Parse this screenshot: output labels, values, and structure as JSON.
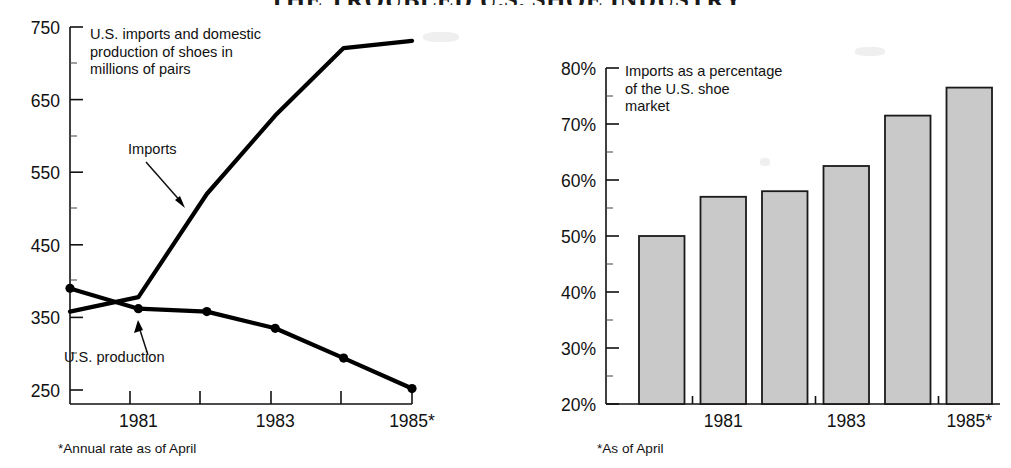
{
  "headline": "THE TROUBLED U.S. SHOE INDUSTRY",
  "left_panel": {
    "note": "U.S. imports and domestic\nproduction of shoes in\nmillions of pairs",
    "series_labels": {
      "imports": "Imports",
      "production": "U.S. production"
    },
    "footnote": "*Annual rate as of April"
  },
  "right_panel": {
    "note": "Imports as a percentage\nof the U.S. shoe\nmarket",
    "footnote": "*As of April"
  },
  "colors": {
    "ink": "#111111",
    "bar_fill": "#c9c9c9",
    "bar_stroke": "#1a1a1a",
    "background": "#ffffff"
  },
  "chart_data": [
    {
      "type": "line",
      "id": "shoe-volume-line-chart",
      "title": "U.S. imports and domestic production of shoes in millions of pairs",
      "xlabel": "",
      "ylabel": "millions of pairs",
      "x": [
        "1980",
        "1981",
        "1982",
        "1983",
        "1984",
        "1985*"
      ],
      "tick_labels": [
        "",
        "1981",
        "",
        "1983",
        "",
        "1985*"
      ],
      "yticks": [
        250,
        350,
        450,
        550,
        650,
        750
      ],
      "ytick_labels": [
        "250",
        "350",
        "450",
        "550",
        "650",
        "750"
      ],
      "ylim": [
        235,
        750
      ],
      "grid": false,
      "legend": "annotations",
      "series": [
        {
          "name": "Imports",
          "values": [
            358,
            378,
            520,
            628,
            721,
            731
          ],
          "markers": false,
          "annotation": "Imports"
        },
        {
          "name": "U.S. production",
          "values": [
            390,
            362,
            358,
            335,
            294,
            252
          ],
          "markers": true,
          "annotation": "U.S. production"
        }
      ],
      "footnote": "*Annual rate as of April"
    },
    {
      "type": "bar",
      "id": "import-share-bar-chart",
      "title": "Imports as a percentage of the U.S. shoe market",
      "xlabel": "",
      "ylabel": "percent of U.S. shoe market",
      "categories": [
        "1980",
        "1981",
        "1982",
        "1983",
        "1984",
        "1985*"
      ],
      "tick_labels": [
        "",
        "1981",
        "",
        "1983",
        "",
        "1985*"
      ],
      "values": [
        50.0,
        57.0,
        58.0,
        62.5,
        71.5,
        76.5
      ],
      "value_suffix": "%",
      "yticks": [
        20,
        30,
        40,
        50,
        60,
        70,
        80
      ],
      "ytick_labels": [
        "20%",
        "30%",
        "40%",
        "50%",
        "60%",
        "70%",
        "80%"
      ],
      "ylim": [
        20,
        80
      ],
      "grid": false,
      "footnote": "*As of April"
    }
  ]
}
